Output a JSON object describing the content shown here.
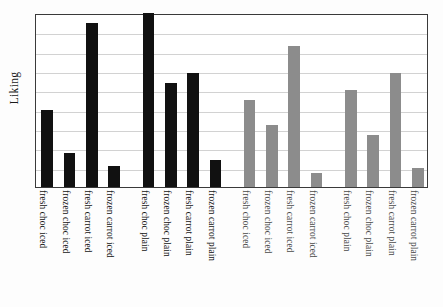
{
  "figure": {
    "background_color": "#fdfdfd",
    "plot_background_color": "#ffffff",
    "frame_color": "#3a3a3a",
    "gridline_color": "#d2d2d2",
    "footnote": ""
  },
  "chart_data": {
    "type": "bar",
    "title": "",
    "subtitle": "",
    "xlabel": "",
    "ylabel": "Liking",
    "ylim": [
      0,
      9
    ],
    "grid": true,
    "gridlines": 8,
    "legend": "none",
    "legend_position": "none",
    "colors": {
      "group_dark": "#111111",
      "group_light": "#8c8c8c"
    },
    "categories": [
      "fresh choc iced",
      "frozen choc iced",
      "fresh carrot iced",
      "frozen carrot iced",
      "fresh choc plain",
      "frozen choc plain",
      "fresh carrot plain",
      "frozen carrot plain",
      "fresh choc iced",
      "frozen choc iced",
      "fresh carrot iced",
      "frozen carrot iced",
      "fresh choc plain",
      "frozen choc plain",
      "fresh carrot plain",
      "frozen carrot plain"
    ],
    "values": [
      4.0,
      1.75,
      8.5,
      1.1,
      9.0,
      5.4,
      5.9,
      1.4,
      4.5,
      3.2,
      7.3,
      0.7,
      5.0,
      2.7,
      5.9,
      1.0
    ],
    "bar_colors": [
      "#111111",
      "#111111",
      "#111111",
      "#111111",
      "#111111",
      "#111111",
      "#111111",
      "#111111",
      "#8c8c8c",
      "#8c8c8c",
      "#8c8c8c",
      "#8c8c8c",
      "#8c8c8c",
      "#8c8c8c",
      "#8c8c8c",
      "#8c8c8c"
    ],
    "groups": [
      {
        "name": "iced-dark",
        "indices": [
          0,
          1,
          2,
          3
        ]
      },
      {
        "name": "plain-dark",
        "indices": [
          4,
          5,
          6,
          7
        ]
      },
      {
        "name": "iced-light",
        "indices": [
          8,
          9,
          10,
          11
        ]
      },
      {
        "name": "plain-light",
        "indices": [
          12,
          13,
          14,
          15
        ]
      }
    ]
  }
}
